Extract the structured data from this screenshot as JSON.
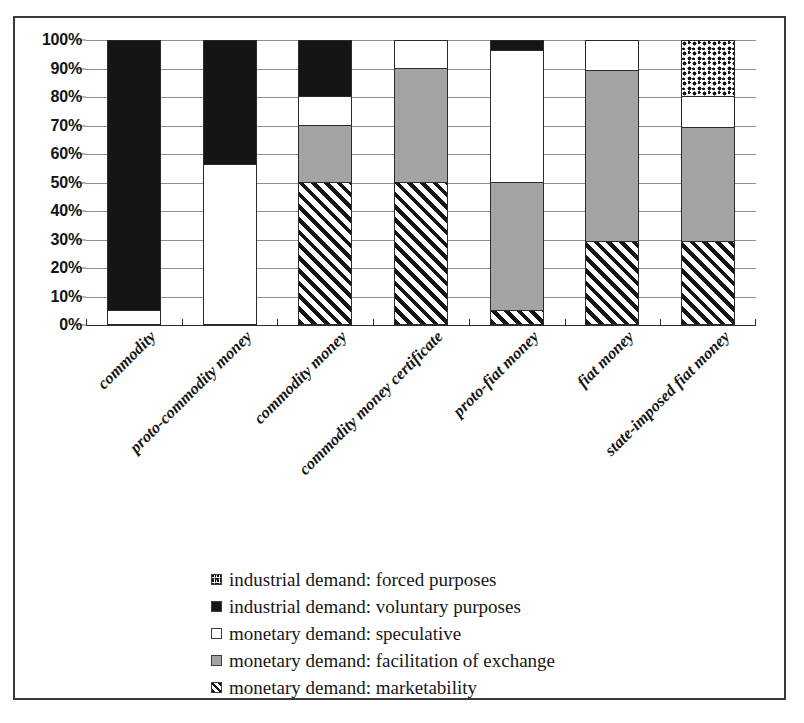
{
  "chart_data": {
    "type": "bar",
    "stacked": true,
    "normalized_percent": true,
    "title": "",
    "xlabel": "",
    "ylabel": "",
    "ylim": [
      0,
      100
    ],
    "ytick_labels": [
      "0%",
      "10%",
      "20%",
      "30%",
      "40%",
      "50%",
      "60%",
      "70%",
      "80%",
      "90%",
      "100%"
    ],
    "ytick_values": [
      0,
      10,
      20,
      30,
      40,
      50,
      60,
      70,
      80,
      90,
      100
    ],
    "grid": true,
    "legend_position": "bottom",
    "categories": [
      "commodity",
      "proto-commodity money",
      "commodity money",
      "commodity money certificate",
      "proto-fiat money",
      "fiat money",
      "state-imposed fiat money"
    ],
    "series": [
      {
        "name": "monetary demand: marketability",
        "pattern": "hatch",
        "values": [
          0,
          0,
          50,
          50,
          5,
          29,
          29
        ]
      },
      {
        "name": "monetary demand: facilitation of exchange",
        "pattern": "gray",
        "values": [
          0,
          0,
          20,
          40,
          45,
          60,
          40
        ]
      },
      {
        "name": "monetary demand: speculative",
        "pattern": "white",
        "values": [
          5,
          56,
          10,
          10,
          46,
          11,
          11
        ]
      },
      {
        "name": "industrial demand: voluntary purposes",
        "pattern": "black",
        "values": [
          95,
          44,
          20,
          0,
          4,
          0,
          0
        ]
      },
      {
        "name": "industrial demand: forced purposes",
        "pattern": "dots",
        "values": [
          0,
          0,
          0,
          0,
          0,
          0,
          20
        ]
      }
    ],
    "legend_entries": [
      {
        "label": "industrial demand: forced purposes",
        "pattern": "dots"
      },
      {
        "label": "industrial demand: voluntary purposes",
        "pattern": "black"
      },
      {
        "label": "monetary demand: speculative",
        "pattern": "white"
      },
      {
        "label": "monetary demand: facilitation of exchange",
        "pattern": "gray"
      },
      {
        "label": "monetary demand: marketability",
        "pattern": "hatch"
      }
    ],
    "colors": {
      "black": "#151515",
      "gray": "#a3a3a3",
      "white": "#ffffff",
      "gridline": "#8e8e8e",
      "axis": "#2b2b2b",
      "frame": "#3a3a3a"
    }
  }
}
